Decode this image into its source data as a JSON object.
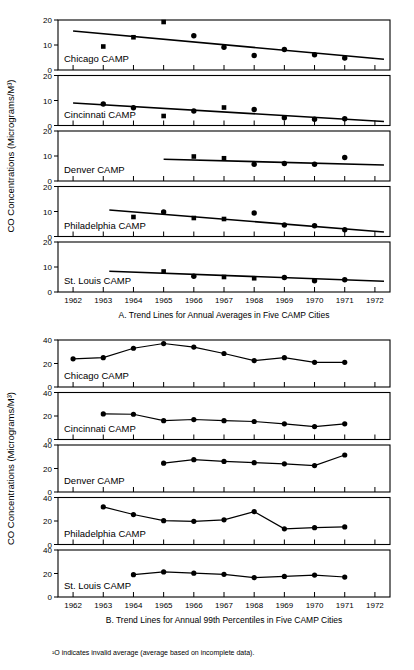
{
  "figure": {
    "y_axis_title_top": "CO Concentrations (Micrograms/M³)",
    "y_axis_title_bottom": "CO Concentrations (Micrograms/M³)",
    "caption_a": "A. Trend Lines for Annual Averages in Five CAMP Cities",
    "caption_b": "B. Trend Lines for Annual 99th Percentiles in Five CAMP Cities",
    "footnote": "¹O indicates invalid average (average based on incomplete data)."
  },
  "chart_data": [
    {
      "type": "scatter",
      "title": "A. Trend Lines for Annual Averages in Five CAMP Cities",
      "xlabel": "",
      "ylabel": "CO Concentrations (Micrograms/M³)",
      "xlim": [
        1961.5,
        1972.5
      ],
      "ylim": [
        0,
        20
      ],
      "yticks": [
        0,
        10,
        20
      ],
      "xticks": [
        1962,
        1963,
        1964,
        1965,
        1966,
        1967,
        1968,
        1969,
        1970,
        1971,
        1972
      ],
      "xtick_labels": [
        "1962",
        "1963",
        "1964",
        "1965",
        "1966",
        "1967",
        "1968",
        "1969",
        "1970",
        "1971",
        "1972"
      ],
      "grid": false,
      "legend": "none",
      "panels": [
        {
          "name": "Chicago CAMP",
          "points": [
            {
              "x": 1963,
              "y": 9.4,
              "marker": "square"
            },
            {
              "x": 1964,
              "y": 13.1,
              "marker": "square"
            },
            {
              "x": 1965,
              "y": 19.2,
              "marker": "square"
            },
            {
              "x": 1966,
              "y": 13.7,
              "marker": "circle"
            },
            {
              "x": 1967,
              "y": 9.1,
              "marker": "circle"
            },
            {
              "x": 1968,
              "y": 5.8,
              "marker": "circle"
            },
            {
              "x": 1969,
              "y": 8.2,
              "marker": "circle"
            },
            {
              "x": 1970,
              "y": 6.1,
              "marker": "circle"
            },
            {
              "x": 1971,
              "y": 4.8,
              "marker": "circle"
            }
          ],
          "trend": {
            "x": [
              1962.0,
              1972.3
            ],
            "y": [
              15.6,
              4.3
            ]
          }
        },
        {
          "name": "Cincinnati CAMP",
          "points": [
            {
              "x": 1963,
              "y": 8.6,
              "marker": "circle"
            },
            {
              "x": 1964,
              "y": 7.1,
              "marker": "circle"
            },
            {
              "x": 1965,
              "y": 3.8,
              "marker": "square"
            },
            {
              "x": 1966,
              "y": 5.8,
              "marker": "circle"
            },
            {
              "x": 1967,
              "y": 7.2,
              "marker": "square"
            },
            {
              "x": 1968,
              "y": 6.4,
              "marker": "circle"
            },
            {
              "x": 1969,
              "y": 3.1,
              "marker": "circle"
            },
            {
              "x": 1970,
              "y": 2.5,
              "marker": "circle"
            },
            {
              "x": 1971,
              "y": 2.7,
              "marker": "circle"
            }
          ],
          "trend": {
            "x": [
              1962.0,
              1972.3
            ],
            "y": [
              9.0,
              1.6
            ]
          }
        },
        {
          "name": "Denver CAMP",
          "points": [
            {
              "x": 1966,
              "y": 9.8,
              "marker": "square"
            },
            {
              "x": 1967,
              "y": 9.1,
              "marker": "square"
            },
            {
              "x": 1968,
              "y": 6.7,
              "marker": "circle"
            },
            {
              "x": 1969,
              "y": 7.0,
              "marker": "circle"
            },
            {
              "x": 1970,
              "y": 6.7,
              "marker": "circle"
            },
            {
              "x": 1971,
              "y": 9.4,
              "marker": "circle"
            }
          ],
          "trend": {
            "x": [
              1965.0,
              1972.3
            ],
            "y": [
              8.7,
              6.4
            ]
          }
        },
        {
          "name": "Philadelphia CAMP",
          "points": [
            {
              "x": 1964,
              "y": 7.8,
              "marker": "square"
            },
            {
              "x": 1965,
              "y": 9.8,
              "marker": "circle"
            },
            {
              "x": 1966,
              "y": 7.4,
              "marker": "square"
            },
            {
              "x": 1967,
              "y": 7.0,
              "marker": "square"
            },
            {
              "x": 1968,
              "y": 9.4,
              "marker": "circle"
            },
            {
              "x": 1969,
              "y": 4.6,
              "marker": "circle"
            },
            {
              "x": 1970,
              "y": 4.3,
              "marker": "circle"
            },
            {
              "x": 1971,
              "y": 2.7,
              "marker": "circle"
            }
          ],
          "trend": {
            "x": [
              1963.2,
              1972.3
            ],
            "y": [
              10.6,
              1.8
            ]
          }
        },
        {
          "name": "St. Louis CAMP",
          "points": [
            {
              "x": 1965,
              "y": 8.2,
              "marker": "square"
            },
            {
              "x": 1966,
              "y": 6.3,
              "marker": "circle"
            },
            {
              "x": 1967,
              "y": 6.0,
              "marker": "square"
            },
            {
              "x": 1968,
              "y": 5.5,
              "marker": "square"
            },
            {
              "x": 1969,
              "y": 5.8,
              "marker": "circle"
            },
            {
              "x": 1970,
              "y": 4.5,
              "marker": "circle"
            },
            {
              "x": 1971,
              "y": 4.9,
              "marker": "circle"
            }
          ],
          "trend": {
            "x": [
              1963.2,
              1972.3
            ],
            "y": [
              8.3,
              4.3
            ]
          }
        }
      ]
    },
    {
      "type": "line",
      "title": "B. Trend Lines for Annual 99th Percentiles in Five CAMP Cities",
      "xlabel": "",
      "ylabel": "CO Concentrations (Micrograms/M³)",
      "xlim": [
        1961.5,
        1972.5
      ],
      "ylim": [
        0,
        40
      ],
      "yticks": [
        0,
        20,
        40
      ],
      "xticks": [
        1962,
        1963,
        1964,
        1965,
        1966,
        1967,
        1968,
        1969,
        1970,
        1971,
        1972
      ],
      "xtick_labels": [
        "1962",
        "1963",
        "1964",
        "1965",
        "1966",
        "1967",
        "1968",
        "1969",
        "1970",
        "1971",
        "1972"
      ],
      "grid": false,
      "legend": "none",
      "panels": [
        {
          "name": "Chicago CAMP",
          "x": [
            1962,
            1963,
            1964,
            1965,
            1966,
            1967,
            1968,
            1969,
            1970,
            1971
          ],
          "y": [
            24.0,
            25.0,
            33.0,
            37.0,
            34.0,
            28.5,
            22.5,
            25.0,
            21.0,
            21.0
          ]
        },
        {
          "name": "Cincinnati CAMP",
          "x": [
            1963,
            1964,
            1965,
            1966,
            1967,
            1968,
            1969,
            1970,
            1971
          ],
          "y": [
            21.8,
            21.5,
            16.0,
            17.0,
            16.0,
            15.3,
            13.3,
            11.0,
            13.3
          ]
        },
        {
          "name": "Denver CAMP",
          "x": [
            1965,
            1966,
            1967,
            1968,
            1969,
            1970,
            1971
          ],
          "y": [
            24.5,
            27.5,
            26.0,
            25.0,
            24.0,
            22.5,
            31.5
          ]
        },
        {
          "name": "Philadelphia CAMP",
          "x": [
            1963,
            1964,
            1965,
            1966,
            1967,
            1968,
            1969,
            1970,
            1971
          ],
          "y": [
            32.0,
            25.5,
            20.3,
            19.7,
            21.0,
            28.0,
            13.3,
            14.3,
            15.0
          ]
        },
        {
          "name": "St. Louis CAMP",
          "x": [
            1964,
            1965,
            1966,
            1967,
            1968,
            1969,
            1970,
            1971
          ],
          "y": [
            19.0,
            21.3,
            20.3,
            19.3,
            16.5,
            17.5,
            18.7,
            17.0
          ]
        }
      ]
    }
  ]
}
